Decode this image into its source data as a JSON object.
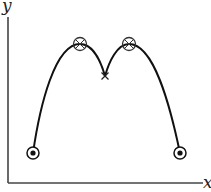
{
  "diagram": {
    "axes": {
      "x_label": "x",
      "y_label": "y",
      "origin": [
        8,
        183
      ],
      "x_end": [
        203,
        183
      ],
      "y_end": [
        8,
        17
      ]
    },
    "curve": {
      "description": "M-shaped curve: two arches meeting at a cusp",
      "color": "#111111",
      "left_arch": {
        "start": [
          33,
          153
        ],
        "peak": [
          80,
          44
        ],
        "end": [
          105,
          76
        ]
      },
      "right_arch": {
        "start": [
          105,
          76
        ],
        "peak": [
          129,
          44
        ],
        "end": [
          180,
          153
        ]
      }
    },
    "markers": [
      {
        "type": "circled-dot",
        "label": "start-point",
        "x": 33,
        "y": 153
      },
      {
        "type": "circled-cross",
        "label": "left-maximum",
        "x": 80,
        "y": 44
      },
      {
        "type": "cross",
        "label": "cusp",
        "x": 105,
        "y": 76
      },
      {
        "type": "circled-cross",
        "label": "right-maximum",
        "x": 129,
        "y": 44
      },
      {
        "type": "circled-dot",
        "label": "end-point",
        "x": 180,
        "y": 153
      }
    ]
  }
}
